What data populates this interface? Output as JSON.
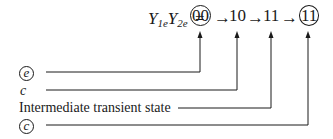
{
  "equation": {
    "lhs_y1": "Y",
    "lhs_sub1": "1e",
    "lhs_y2": "Y",
    "lhs_sub2": "2e",
    "equals": "=",
    "states": [
      "00",
      "10",
      "11",
      "11"
    ],
    "circled_states": [
      0,
      3
    ],
    "arrow": "→"
  },
  "labels": [
    {
      "text": "e",
      "circled": true,
      "points_to_state": 0
    },
    {
      "text": "c",
      "circled": false,
      "points_to_state": 1
    },
    {
      "text": "Intermediate transient state",
      "circled": false,
      "points_to_state": 2
    },
    {
      "text": "c",
      "circled": true,
      "points_to_state": 3
    }
  ]
}
